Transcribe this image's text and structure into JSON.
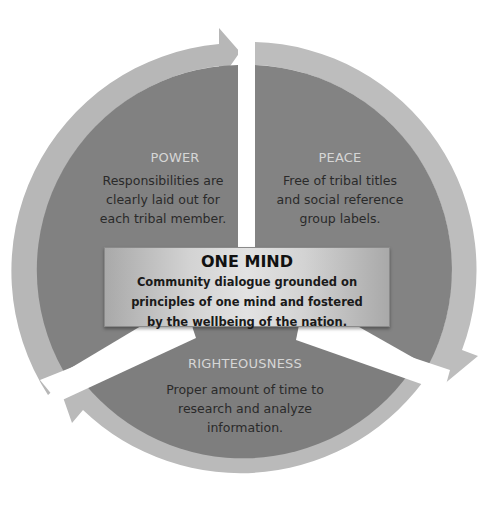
{
  "diagram": {
    "type": "cycle",
    "colors": {
      "segment_fill": "#808080",
      "arrow_fill": "#b9b9b9",
      "segment_title": "#d6d6d6",
      "segment_text": "#2a2a2a",
      "center_box": "#d3d3d3",
      "background": "#ffffff"
    },
    "segments": [
      {
        "title": "POWER",
        "lines": [
          "Responsibilities are",
          "clearly laid out for",
          "each tribal member."
        ]
      },
      {
        "title": "PEACE",
        "lines": [
          "Free of tribal titles",
          "and social reference",
          "group labels."
        ]
      },
      {
        "title": "RIGHTEOUSNESS",
        "lines": [
          "Proper amount of time to",
          "research and analyze",
          "information."
        ]
      }
    ],
    "center": {
      "title": "ONE MIND",
      "lines": [
        "Community dialogue grounded on",
        "principles of one mind and fostered",
        "by the wellbeing of the nation."
      ]
    }
  }
}
